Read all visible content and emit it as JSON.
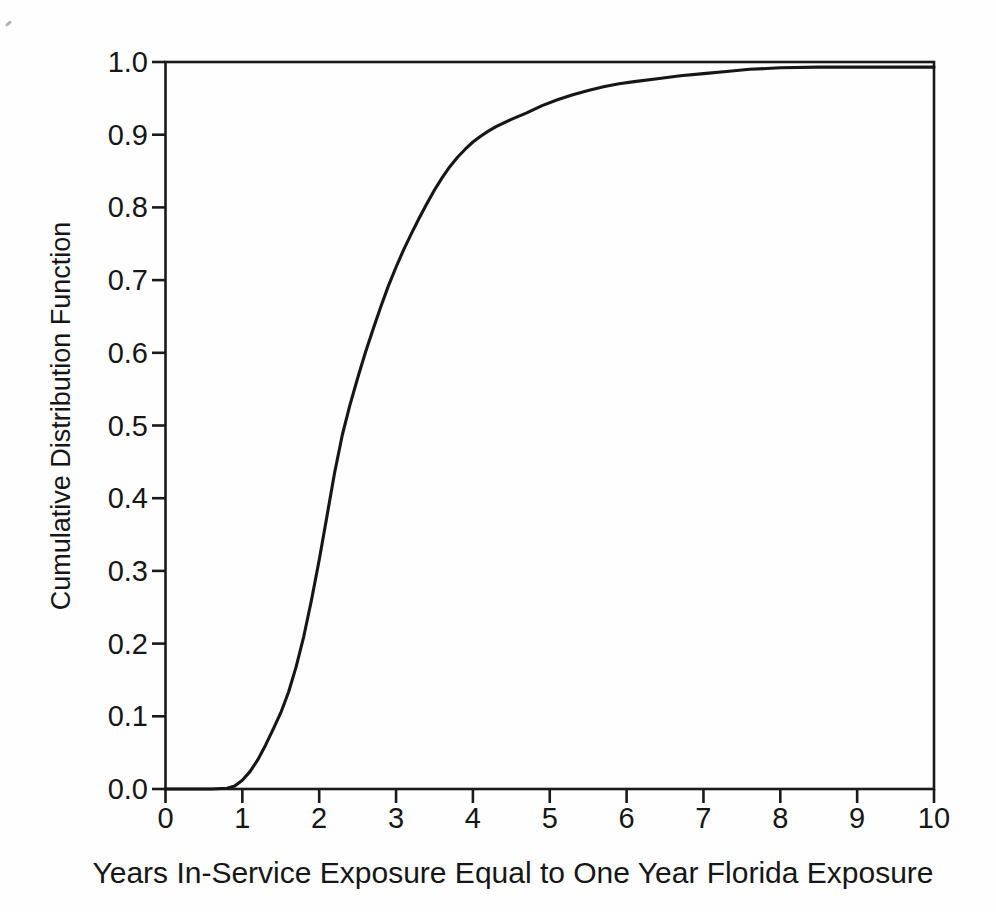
{
  "figure": {
    "x_axis_title": "Years In-Service Exposure Equal to One Year Florida Exposure",
    "y_axis_title": "Cumulative Distribution Function"
  },
  "colors": {
    "line": "#161616",
    "frame": "#1a1a1a",
    "background": "#fefefe"
  },
  "chart_data": {
    "type": "line",
    "title": "",
    "xlabel": "Years In-Service Exposure Equal to One Year Florida Exposure",
    "ylabel": "Cumulative Distribution Function",
    "xlim": [
      0,
      10
    ],
    "ylim": [
      0.0,
      1.0
    ],
    "grid": false,
    "legend": "none",
    "x_ticks": [
      0,
      1,
      2,
      3,
      4,
      5,
      6,
      7,
      8,
      9,
      10
    ],
    "x_tick_labels": [
      "0",
      "1",
      "2",
      "3",
      "4",
      "5",
      "6",
      "7",
      "8",
      "9",
      "10"
    ],
    "y_ticks": [
      0.0,
      0.1,
      0.2,
      0.3,
      0.4,
      0.5,
      0.6,
      0.7,
      0.8,
      0.9,
      1.0
    ],
    "y_tick_labels": [
      "0.0",
      "0.1",
      "0.2",
      "0.3",
      "0.4",
      "0.5",
      "0.6",
      "0.7",
      "0.8",
      "0.9",
      "1.0"
    ],
    "series": [
      {
        "name": "cumulative-distribution-function",
        "points": [
          [
            0.0,
            0.0
          ],
          [
            0.6,
            0.0
          ],
          [
            0.8,
            0.001
          ],
          [
            0.9,
            0.004
          ],
          [
            1.0,
            0.012
          ],
          [
            1.1,
            0.024
          ],
          [
            1.2,
            0.04
          ],
          [
            1.3,
            0.06
          ],
          [
            1.4,
            0.082
          ],
          [
            1.5,
            0.105
          ],
          [
            1.6,
            0.133
          ],
          [
            1.7,
            0.168
          ],
          [
            1.8,
            0.21
          ],
          [
            1.9,
            0.26
          ],
          [
            2.0,
            0.315
          ],
          [
            2.1,
            0.375
          ],
          [
            2.2,
            0.435
          ],
          [
            2.3,
            0.487
          ],
          [
            2.4,
            0.528
          ],
          [
            2.5,
            0.565
          ],
          [
            2.6,
            0.6
          ],
          [
            2.7,
            0.632
          ],
          [
            2.8,
            0.663
          ],
          [
            2.9,
            0.692
          ],
          [
            3.0,
            0.718
          ],
          [
            3.1,
            0.742
          ],
          [
            3.2,
            0.764
          ],
          [
            3.3,
            0.785
          ],
          [
            3.4,
            0.805
          ],
          [
            3.5,
            0.824
          ],
          [
            3.6,
            0.841
          ],
          [
            3.7,
            0.856
          ],
          [
            3.8,
            0.869
          ],
          [
            3.9,
            0.88
          ],
          [
            4.0,
            0.89
          ],
          [
            4.1,
            0.898
          ],
          [
            4.2,
            0.905
          ],
          [
            4.3,
            0.911
          ],
          [
            4.5,
            0.921
          ],
          [
            4.7,
            0.93
          ],
          [
            4.9,
            0.94
          ],
          [
            5.1,
            0.948
          ],
          [
            5.3,
            0.955
          ],
          [
            5.5,
            0.961
          ],
          [
            5.7,
            0.966
          ],
          [
            5.9,
            0.97
          ],
          [
            6.1,
            0.973
          ],
          [
            6.4,
            0.977
          ],
          [
            6.7,
            0.981
          ],
          [
            7.0,
            0.984
          ],
          [
            7.3,
            0.987
          ],
          [
            7.6,
            0.99
          ],
          [
            8.0,
            0.992
          ],
          [
            8.5,
            0.993
          ],
          [
            9.0,
            0.993
          ],
          [
            9.5,
            0.993
          ],
          [
            10.0,
            0.993
          ]
        ]
      }
    ]
  }
}
